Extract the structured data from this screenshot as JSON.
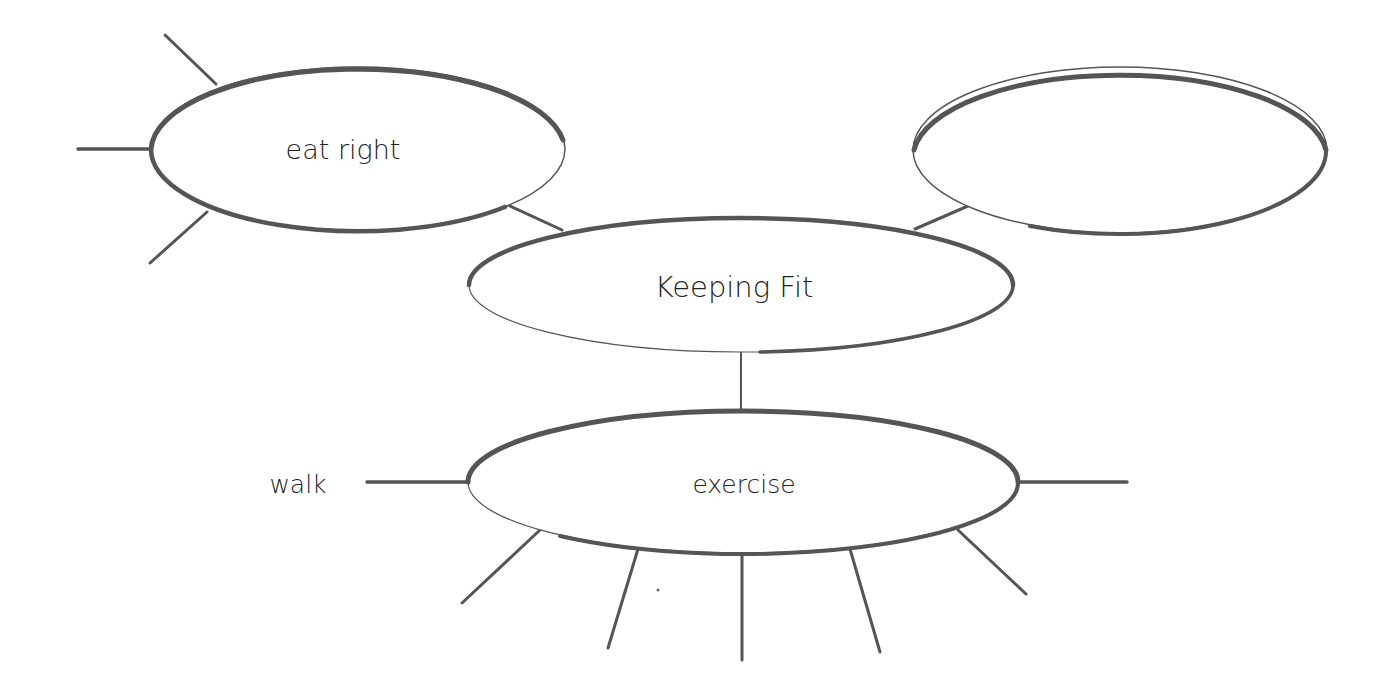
{
  "diagram": {
    "type": "concept-web",
    "center": {
      "label": "Keeping Fit"
    },
    "nodes": [
      {
        "id": "eat-right",
        "label": "eat right"
      },
      {
        "id": "blank",
        "label": ""
      },
      {
        "id": "exercise",
        "label": "exercise"
      }
    ],
    "spoke_labels": [
      {
        "parent": "exercise",
        "label": "walk"
      }
    ],
    "colors": {
      "stroke": "#555555",
      "text": "#222222",
      "background": "#ffffff"
    }
  }
}
